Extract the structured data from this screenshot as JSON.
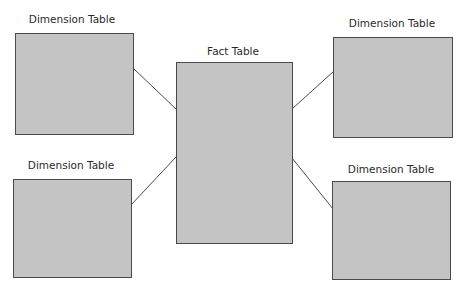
{
  "diagram": {
    "type": "star-schema",
    "center": {
      "label": "Fact Table"
    },
    "dimensions": [
      {
        "position": "top-left",
        "label": "Dimension Table"
      },
      {
        "position": "top-right",
        "label": "Dimension Table"
      },
      {
        "position": "bottom-left",
        "label": "Dimension Table"
      },
      {
        "position": "bottom-right",
        "label": "Dimension Table"
      }
    ],
    "colors": {
      "box_fill": "#c4c4c4",
      "box_border": "#4a4a4a",
      "line": "#4a4a4a",
      "background": "#ffffff"
    }
  }
}
